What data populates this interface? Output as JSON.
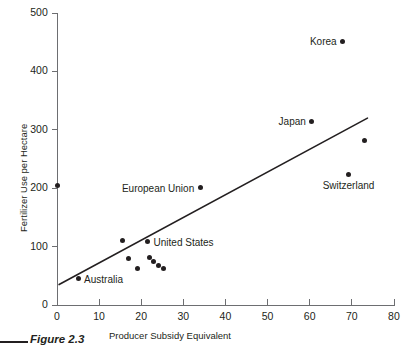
{
  "figure": {
    "caption": "Figure 2.3"
  },
  "chart_data": {
    "type": "scatter",
    "title": "",
    "xlabel": "Producer Subsidy Equivalent",
    "ylabel": "Fertilizer Use per Hectare",
    "xlim": [
      0,
      80
    ],
    "ylim": [
      0,
      500
    ],
    "xticks": [
      0,
      10,
      20,
      30,
      40,
      50,
      60,
      70,
      80
    ],
    "yticks": [
      0,
      100,
      200,
      300,
      400,
      500
    ],
    "xticklabels": [
      "0",
      "10",
      "20",
      "30",
      "40",
      "50",
      "60",
      "70",
      "80"
    ],
    "yticklabels": [
      "0",
      "100",
      "200",
      "300",
      "400",
      "500"
    ],
    "grid": false,
    "legend": false,
    "points": [
      {
        "x": 0,
        "y": 205,
        "label": "",
        "label_pos": "right"
      },
      {
        "x": 5,
        "y": 45,
        "label": "Australia",
        "label_pos": "right"
      },
      {
        "x": 15.5,
        "y": 110,
        "label": "",
        "label_pos": "right"
      },
      {
        "x": 17,
        "y": 80,
        "label": "",
        "label_pos": "right"
      },
      {
        "x": 19,
        "y": 62,
        "label": "",
        "label_pos": "right"
      },
      {
        "x": 21.5,
        "y": 108,
        "label": "United States",
        "label_pos": "right"
      },
      {
        "x": 22,
        "y": 82,
        "label": "",
        "label_pos": "right"
      },
      {
        "x": 23,
        "y": 74,
        "label": "",
        "label_pos": "right"
      },
      {
        "x": 24.2,
        "y": 68,
        "label": "",
        "label_pos": "right"
      },
      {
        "x": 25.2,
        "y": 62,
        "label": "",
        "label_pos": "right"
      },
      {
        "x": 34,
        "y": 201,
        "label": "European Union",
        "label_pos": "left"
      },
      {
        "x": 60.5,
        "y": 315,
        "label": "Japan",
        "label_pos": "left"
      },
      {
        "x": 67.8,
        "y": 452,
        "label": "Korea",
        "label_pos": "left"
      },
      {
        "x": 69.2,
        "y": 224,
        "label": "Switzerland",
        "label_pos": "below"
      },
      {
        "x": 73,
        "y": 281,
        "label": "",
        "label_pos": "right"
      }
    ],
    "trendline": {
      "x_start": 0.5,
      "y_start": 35,
      "x_end": 73.7,
      "y_end": 320
    },
    "colors": {
      "point": "#231f20",
      "axis": "#6d6e71",
      "trendline": "#231f20",
      "text": "#231f20",
      "background": "#ffffff"
    }
  }
}
